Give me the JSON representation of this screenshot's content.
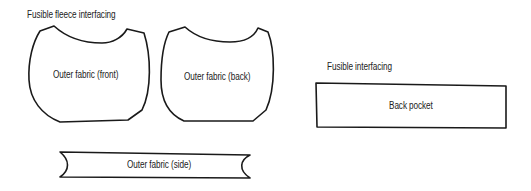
{
  "labels": {
    "fleece_interfacing": "Fusible fleece interfacing",
    "fusible_interfacing": "Fusible interfacing"
  },
  "pieces": [
    {
      "id": "front",
      "label": "Outer fabric (front)"
    },
    {
      "id": "back",
      "label": "Outer fabric (back)"
    },
    {
      "id": "pocket",
      "label": "Back pocket"
    },
    {
      "id": "side",
      "label": "Outer fabric (side)"
    }
  ],
  "colors": {
    "line": "#1a1a1a",
    "text": "#222222",
    "background": "#ffffff"
  }
}
